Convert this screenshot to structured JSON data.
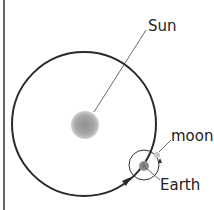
{
  "diagram": {
    "labels": {
      "sun": "Sun",
      "moon": "moon",
      "earth": "Earth"
    },
    "colors": {
      "orbit": "#2a2a2a",
      "sun": "#9a9a9a",
      "earth": "#7a7a7a",
      "moon": "#c8c8c8",
      "background": "#ffffff"
    }
  }
}
